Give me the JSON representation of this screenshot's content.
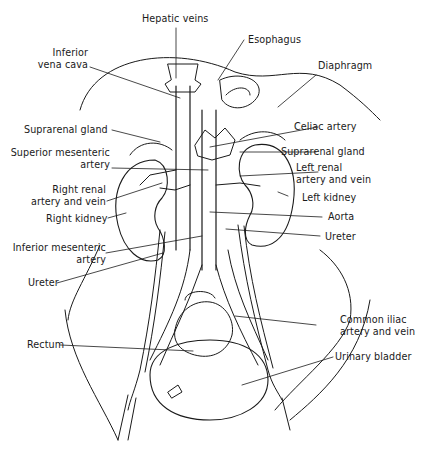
{
  "diagram": {
    "labels_left": [
      {
        "id": "inferior-vena-cava",
        "text_lines": [
          "Inferior",
          "vena cava"
        ]
      },
      {
        "id": "suprarenal-gland-right",
        "text_lines": [
          "Suprarenal gland"
        ]
      },
      {
        "id": "superior-mesenteric-artery",
        "text_lines": [
          "Superior mesenteric",
          "artery"
        ]
      },
      {
        "id": "right-renal-artery-vein",
        "text_lines": [
          "Right renal",
          "artery and vein"
        ]
      },
      {
        "id": "right-kidney",
        "text_lines": [
          "Right kidney"
        ]
      },
      {
        "id": "inferior-mesenteric-artery",
        "text_lines": [
          "Inferior mesenteric",
          "artery"
        ]
      },
      {
        "id": "ureter-right",
        "text_lines": [
          "Ureter"
        ]
      },
      {
        "id": "rectum",
        "text_lines": [
          "Rectum"
        ]
      }
    ],
    "labels_top": [
      {
        "id": "hepatic-veins",
        "text_lines": [
          "Hepatic veins"
        ]
      },
      {
        "id": "esophagus",
        "text_lines": [
          "Esophagus"
        ]
      }
    ],
    "labels_right": [
      {
        "id": "diaphragm",
        "text_lines": [
          "Diaphragm"
        ]
      },
      {
        "id": "celiac-artery",
        "text_lines": [
          "Celiac artery"
        ]
      },
      {
        "id": "suprarenal-gland-left",
        "text_lines": [
          "Suprarenal gland"
        ]
      },
      {
        "id": "left-renal-artery-vein",
        "text_lines": [
          "Left renal",
          "artery and vein"
        ]
      },
      {
        "id": "left-kidney",
        "text_lines": [
          "Left kidney"
        ]
      },
      {
        "id": "aorta",
        "text_lines": [
          "Aorta"
        ]
      },
      {
        "id": "ureter-left",
        "text_lines": [
          "Ureter"
        ]
      },
      {
        "id": "common-iliac-artery-vein",
        "text_lines": [
          "Common iliac",
          "artery and vein"
        ]
      },
      {
        "id": "urinary-bladder",
        "text_lines": [
          "Urinary bladder"
        ]
      }
    ],
    "line_color": "#1a1a1a"
  }
}
